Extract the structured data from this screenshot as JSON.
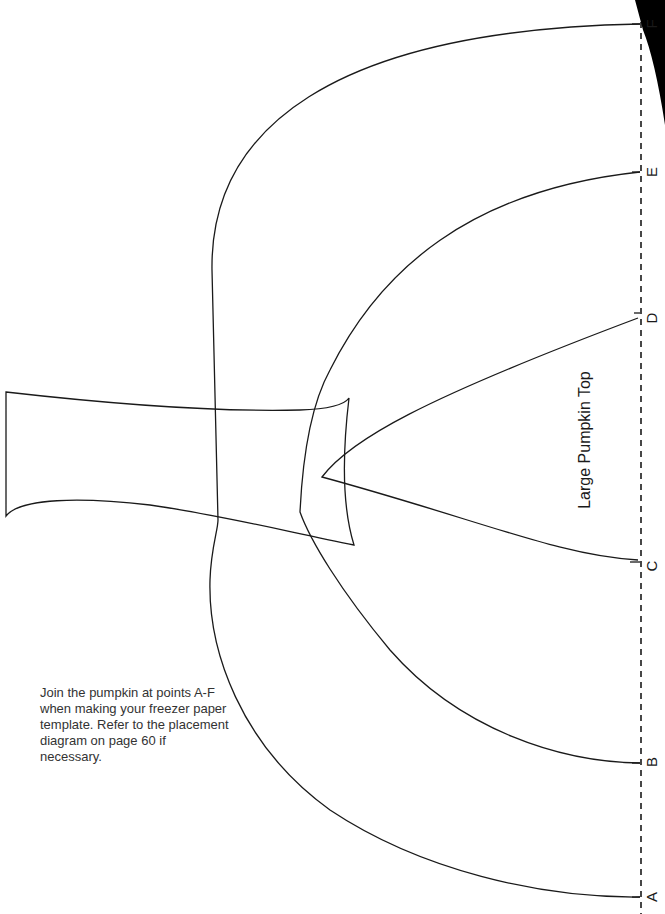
{
  "piece": {
    "title": "Large Pumpkin Top"
  },
  "instructions": {
    "text": "Join the pumpkin at points A-F when making your freezer paper template. Refer to the placement diagram on page 60 if necessary."
  },
  "join_points": [
    {
      "label": "A",
      "y": 897
    },
    {
      "label": "B",
      "y": 762
    },
    {
      "label": "C",
      "y": 566
    },
    {
      "label": "D",
      "y": 318
    },
    {
      "label": "E",
      "y": 172
    },
    {
      "label": "F",
      "y": 24
    }
  ],
  "colors": {
    "line": "#1a1a1a",
    "background": "#ffffff",
    "text": "#333333"
  }
}
